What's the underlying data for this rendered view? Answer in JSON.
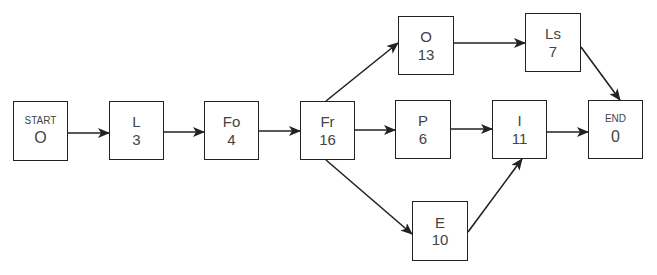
{
  "diagram": {
    "type": "activity-network",
    "nodes": [
      {
        "id": "start",
        "label": "START",
        "value": "O",
        "x": 13,
        "y": 101,
        "w": 55,
        "h": 60,
        "small": true
      },
      {
        "id": "L",
        "label": "L",
        "value": "3",
        "x": 109,
        "y": 101,
        "w": 55,
        "h": 59
      },
      {
        "id": "Fo",
        "label": "Fo",
        "value": "4",
        "x": 204,
        "y": 101,
        "w": 55,
        "h": 59
      },
      {
        "id": "Fr",
        "label": "Fr",
        "value": "16",
        "x": 300,
        "y": 101,
        "w": 55,
        "h": 59
      },
      {
        "id": "O",
        "label": "O",
        "value": "13",
        "x": 398,
        "y": 16,
        "w": 56,
        "h": 59
      },
      {
        "id": "Ls",
        "label": "Ls",
        "value": "7",
        "x": 525,
        "y": 13,
        "w": 56,
        "h": 59
      },
      {
        "id": "P",
        "label": "P",
        "value": "6",
        "x": 395,
        "y": 100,
        "w": 56,
        "h": 59
      },
      {
        "id": "I",
        "label": "I",
        "value": "11",
        "x": 492,
        "y": 100,
        "w": 55,
        "h": 59
      },
      {
        "id": "E",
        "label": "E",
        "value": "10",
        "x": 412,
        "y": 201,
        "w": 56,
        "h": 60
      },
      {
        "id": "end",
        "label": "END",
        "value": "0",
        "x": 588,
        "y": 100,
        "w": 55,
        "h": 59,
        "small": true
      }
    ],
    "edges": [
      {
        "from": "start",
        "to": "L",
        "x1": 68,
        "y1": 133,
        "x2": 109,
        "y2": 133
      },
      {
        "from": "L",
        "to": "Fo",
        "x1": 164,
        "y1": 132,
        "x2": 204,
        "y2": 132
      },
      {
        "from": "Fo",
        "to": "Fr",
        "x1": 259,
        "y1": 131,
        "x2": 300,
        "y2": 131
      },
      {
        "from": "Fr",
        "to": "O",
        "x1": 326,
        "y1": 101,
        "x2": 398,
        "y2": 43
      },
      {
        "from": "Fr",
        "to": "P",
        "x1": 355,
        "y1": 130,
        "x2": 395,
        "y2": 130
      },
      {
        "from": "Fr",
        "to": "E",
        "x1": 326,
        "y1": 160,
        "x2": 412,
        "y2": 234
      },
      {
        "from": "O",
        "to": "Ls",
        "x1": 454,
        "y1": 43,
        "x2": 525,
        "y2": 43
      },
      {
        "from": "P",
        "to": "I",
        "x1": 451,
        "y1": 129,
        "x2": 492,
        "y2": 129
      },
      {
        "from": "E",
        "to": "I",
        "x1": 468,
        "y1": 232,
        "x2": 522,
        "y2": 159
      },
      {
        "from": "I",
        "to": "end",
        "x1": 547,
        "y1": 132,
        "x2": 588,
        "y2": 132
      },
      {
        "from": "Ls",
        "to": "end",
        "x1": 581,
        "y1": 47,
        "x2": 620,
        "y2": 100
      }
    ],
    "colors": {
      "stroke": "#222222",
      "text": "#444444",
      "background": "#ffffff"
    }
  }
}
